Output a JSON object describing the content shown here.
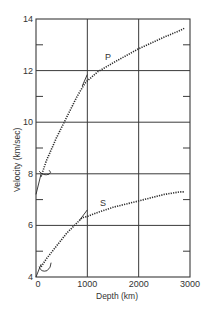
{
  "chart_data": {
    "type": "line",
    "title": "",
    "xlabel": "Depth (km)",
    "ylabel": "Velocity (km/sec)",
    "xlim": [
      0,
      3000
    ],
    "ylim": [
      4,
      14
    ],
    "x_ticks": [
      0,
      1000,
      2000,
      3000
    ],
    "x_tick_labels": [
      "0",
      "1000",
      "2000",
      "3000"
    ],
    "y_ticks": [
      4,
      6,
      8,
      10,
      12,
      14
    ],
    "y_tick_labels": [
      "4",
      "6",
      "8",
      "10",
      "12",
      "14"
    ],
    "y_minor_ticks": [
      5,
      7,
      9,
      11,
      13
    ],
    "grid": true,
    "legend": "none (curves labeled inline)",
    "series": [
      {
        "name": "P",
        "style": "dotted",
        "x": [
          100,
          200,
          400,
          600,
          800,
          950,
          1000,
          1200,
          1500,
          2000,
          2500,
          2800,
          2900
        ],
        "y": [
          7.9,
          8.5,
          9.4,
          10.2,
          11.0,
          11.5,
          11.6,
          11.95,
          12.3,
          12.85,
          13.3,
          13.55,
          13.65
        ]
      },
      {
        "name": "P (upper mantle solid segment)",
        "style": "solid",
        "x": [
          0,
          100
        ],
        "y": [
          7.2,
          8.0
        ]
      },
      {
        "name": "P (alt. steep extension)",
        "style": "solid",
        "x": [
          900,
          1000
        ],
        "y": [
          11.4,
          11.85
        ]
      },
      {
        "name": "S",
        "style": "dotted",
        "x": [
          100,
          200,
          400,
          600,
          800,
          900,
          1000,
          1200,
          1500,
          2000,
          2500,
          2800,
          2900
        ],
        "y": [
          4.4,
          4.7,
          5.2,
          5.7,
          6.1,
          6.3,
          6.35,
          6.5,
          6.7,
          6.95,
          7.2,
          7.3,
          7.3
        ]
      },
      {
        "name": "S (upper mantle solid segment)",
        "style": "solid",
        "x": [
          0,
          100
        ],
        "y": [
          4.0,
          4.5
        ]
      },
      {
        "name": "S (alt. steep extension)",
        "style": "solid",
        "x": [
          850,
          1000
        ],
        "y": [
          6.2,
          6.6
        ]
      }
    ],
    "annotations": [
      {
        "text": "P",
        "x": 1350,
        "y": 12.5
      },
      {
        "text": "S",
        "x": 1250,
        "y": 6.8
      }
    ]
  },
  "labels": {
    "xlabel": "Depth (km)",
    "ylabel": "Velocity (km/sec)",
    "p_label": "P",
    "s_label": "S"
  }
}
